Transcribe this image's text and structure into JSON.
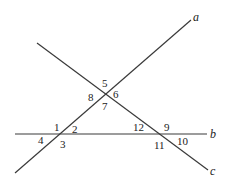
{
  "diagram": {
    "type": "transversal-lines",
    "lines": [
      {
        "id": "a",
        "label": "a"
      },
      {
        "id": "b",
        "label": "b"
      },
      {
        "id": "c",
        "label": "c"
      }
    ],
    "angles": {
      "a1": "1",
      "a2": "2",
      "a3": "3",
      "a4": "4",
      "a5": "5",
      "a6": "6",
      "a7": "7",
      "a8": "8",
      "a9": "9",
      "a10": "10",
      "a11": "11",
      "a12": "12"
    },
    "colors": {
      "stroke": "#3a3a3a",
      "text": "#222222",
      "background": "#ffffff"
    }
  }
}
